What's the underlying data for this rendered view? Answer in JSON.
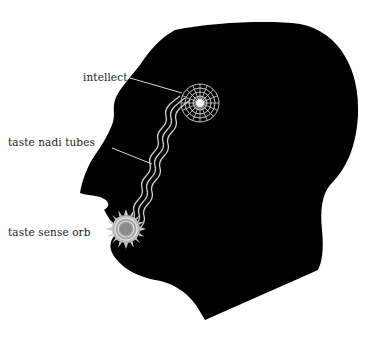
{
  "diagram": {
    "colors": {
      "background": "#ffffff",
      "silhouette": "#000000",
      "line_art": "#d8d8d8",
      "orb_core": "#8a8a8a",
      "label_text": "#222222"
    },
    "labels": [
      {
        "id": "intellect",
        "text": "intellect",
        "points_to": "intellect-orb"
      },
      {
        "id": "taste-nadi-tubes",
        "text": "taste nadi tubes",
        "points_to": "wavy-tubes"
      },
      {
        "id": "taste-sense-orb",
        "text": "taste sense orb",
        "points_to": "sun-orb-at-mouth"
      }
    ],
    "elements": [
      {
        "name": "intellect-orb",
        "description": "Web-like circular grid orb with glowing center, at forehead/brain area"
      },
      {
        "name": "wavy-tubes",
        "description": "Three parallel wavy lines connecting the mouth orb to the intellect orb"
      },
      {
        "name": "taste-sense-orb",
        "description": "Sun-like orb with spiky rays and concentric rings, at the mouth"
      }
    ]
  }
}
